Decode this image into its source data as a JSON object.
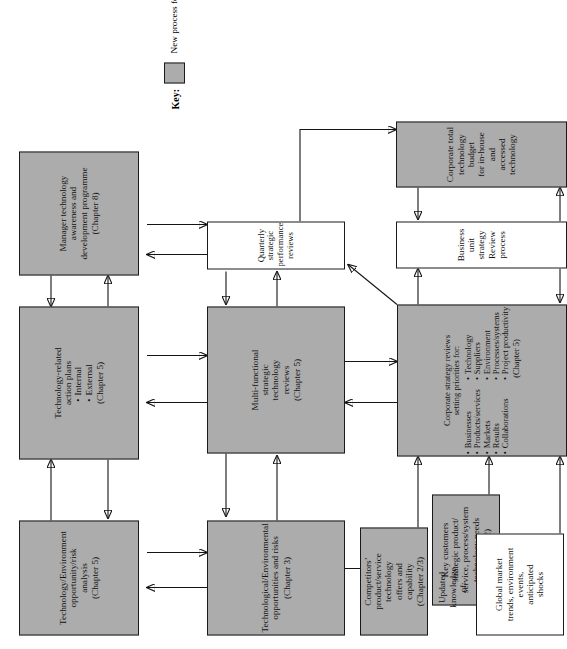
{
  "figure": {
    "orientation": "rotated-90-ccw",
    "background": "#ffffff",
    "new_process_fill": "#acacac",
    "existing_process_fill": "#ffffff",
    "line_color": "#141414"
  },
  "legend": {
    "label": "Key:",
    "swatch_description": "gray-filled-rectangle",
    "text": "New process for many companies"
  },
  "nodes": {
    "tech_env_opportunity_risk": {
      "title": "Technology/Environment",
      "line2": "opportunity/risk",
      "line3": "analysis",
      "chapter": "(Chapter 5)",
      "fill": "new"
    },
    "tech_related_action_plans": {
      "line1": "Technology-related",
      "line2": "action plans",
      "bullets": [
        "Internal",
        "External"
      ],
      "chapter": "(Chapter 5)",
      "fill": "new"
    },
    "manager_tech_awareness": {
      "line1": "Manager technology",
      "line2": "awareness and",
      "line3": "development programme",
      "chapter": "(Chapter 8)",
      "fill": "new"
    },
    "technological_env_opps_risks": {
      "line1": "Technological/Environmental",
      "line2": "opportunities and risks",
      "chapter": "(Chapter 3)",
      "fill": "new"
    },
    "multi_functional_reviews": {
      "line1": "Multi-functional",
      "line2": "strategic",
      "line3": "technology",
      "line4": "reviews",
      "chapter": "(Chapter 5)",
      "fill": "new"
    },
    "quarterly_strategic_reviews": {
      "line1": "Quarterly strategic",
      "line2": "performance reviews",
      "fill": "existing"
    },
    "competitors_offers": {
      "line1": "Competitors’",
      "line2": "product/service",
      "line3": "technology",
      "line4": "offers and",
      "line5": "capability",
      "chapter": "(Chapter 2/3)",
      "fill": "new"
    },
    "key_customers_needs": {
      "line1": "Key customers",
      "line2": "strategic product/",
      "line3": "service, process/system",
      "line4": "technology needs",
      "chapter": "(Chapter 2)",
      "fill": "new"
    },
    "updated_knowledge": {
      "line1": "Updated",
      "line2": "knowledge",
      "line3": "of:",
      "fill": "none"
    },
    "global_market_trends": {
      "line1": "Global market",
      "line2": "trends, environment",
      "line3": "events,",
      "line4": "anticipated",
      "line5": "shocks",
      "fill": "existing"
    },
    "corporate_strategy_reviews": {
      "line1": "Corporate strategy reviews",
      "line2": "setting priorities for:",
      "bullets_left": [
        "Businesses",
        "Products/services",
        "Markets",
        "Results",
        "Collaborations"
      ],
      "bullets_right": [
        "Technology",
        "Suppliers",
        "Environment",
        "Processes/systems",
        "Project productivity"
      ],
      "chapter": "(Chapter 5)",
      "fill": "new"
    },
    "business_unit_strategy": {
      "line1": "Business unit strategy",
      "line2": "Review process",
      "fill": "existing"
    },
    "corporate_total_budget": {
      "line1": "Corporate total",
      "line2": "technology budget",
      "line3": "for in-house and",
      "line4": "accessed technology",
      "fill": "new"
    }
  }
}
